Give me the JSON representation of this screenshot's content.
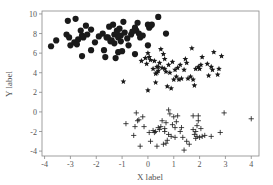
{
  "chart_data": {
    "type": "scatter",
    "title": "",
    "xlabel": "X label",
    "ylabel": "Y label",
    "xlim": [
      -4.1,
      4.3
    ],
    "ylim": [
      -4.5,
      10.3
    ],
    "xticks": [
      -4,
      -3,
      -2,
      -1,
      0,
      1,
      2,
      3,
      4
    ],
    "yticks": [
      -4,
      -2,
      0,
      2,
      4,
      6,
      8,
      10
    ],
    "grid": false,
    "legend": null,
    "series": [
      {
        "name": "cluster-1",
        "marker": "circle",
        "color": "#1a1a1a",
        "points": [
          [
            -3.75,
            6.7
          ],
          [
            -3.55,
            7.3
          ],
          [
            -3.1,
            9.3
          ],
          [
            -3.15,
            7.9
          ],
          [
            -3.05,
            7.6
          ],
          [
            -3.0,
            6.8
          ],
          [
            -2.85,
            7.1
          ],
          [
            -2.8,
            9.5
          ],
          [
            -2.75,
            6.9
          ],
          [
            -2.6,
            8.3
          ],
          [
            -2.55,
            7.8
          ],
          [
            -2.5,
            7.6
          ],
          [
            -2.55,
            5.7
          ],
          [
            -2.4,
            8.8
          ],
          [
            -2.35,
            7.9
          ],
          [
            -2.2,
            8.4
          ],
          [
            -2.2,
            6.3
          ],
          [
            -2.05,
            7.1
          ],
          [
            -1.9,
            7.7
          ],
          [
            -1.75,
            8.0
          ],
          [
            -1.7,
            6.3
          ],
          [
            -1.65,
            5.6
          ],
          [
            -1.55,
            7.6
          ],
          [
            -1.5,
            8.7
          ],
          [
            -1.45,
            7.2
          ],
          [
            -1.35,
            8.9
          ],
          [
            -1.3,
            7.9
          ],
          [
            -1.3,
            7.0
          ],
          [
            -1.2,
            8.3
          ],
          [
            -1.2,
            8.0
          ],
          [
            -1.15,
            7.6
          ],
          [
            -1.1,
            8.5
          ],
          [
            -1.05,
            7.8
          ],
          [
            -1.0,
            6.2
          ],
          [
            -1.25,
            5.5
          ],
          [
            -1.15,
            6.1
          ],
          [
            -0.95,
            9.2
          ],
          [
            -0.9,
            8.1
          ],
          [
            -0.8,
            7.5
          ],
          [
            -0.75,
            6.8
          ],
          [
            -0.65,
            7.9
          ],
          [
            -0.5,
            8.6
          ],
          [
            -0.45,
            8.3
          ],
          [
            -0.4,
            9.1
          ],
          [
            -0.35,
            8.0
          ],
          [
            -0.3,
            7.6
          ],
          [
            -0.2,
            7.8
          ],
          [
            -0.5,
            5.9
          ],
          [
            -1.05,
            7.2
          ],
          [
            0.0,
            8.9
          ],
          [
            0.05,
            8.6
          ],
          [
            0.1,
            8.8
          ],
          [
            0.15,
            8.9
          ],
          [
            0.4,
            9.7
          ],
          [
            0.0,
            6.8
          ],
          [
            0.7,
            8.0
          ],
          [
            -1.4,
            7.3
          ],
          [
            -1.6,
            7.6
          ],
          [
            -2.7,
            7.4
          ],
          [
            -0.6,
            8.2
          ]
        ]
      },
      {
        "name": "cluster-2",
        "marker": "star",
        "color": "#1a1a1a",
        "points": [
          [
            -0.95,
            3.1
          ],
          [
            -0.25,
            5.2
          ],
          [
            -0.1,
            5.5
          ],
          [
            -0.05,
            4.9
          ],
          [
            0.0,
            6.0
          ],
          [
            0.05,
            5.6
          ],
          [
            0.1,
            5.3
          ],
          [
            0.2,
            4.4
          ],
          [
            0.25,
            5.2
          ],
          [
            0.3,
            3.9
          ],
          [
            0.35,
            4.0
          ],
          [
            0.35,
            4.6
          ],
          [
            0.4,
            4.2
          ],
          [
            0.45,
            5.0
          ],
          [
            0.5,
            6.4
          ],
          [
            0.55,
            4.5
          ],
          [
            0.6,
            5.9
          ],
          [
            0.65,
            5.4
          ],
          [
            0.7,
            4.1
          ],
          [
            0.75,
            2.6
          ],
          [
            0.8,
            4.8
          ],
          [
            0.85,
            4.0
          ],
          [
            0.9,
            2.4
          ],
          [
            0.95,
            5.1
          ],
          [
            1.0,
            3.3
          ],
          [
            1.05,
            4.3
          ],
          [
            1.1,
            3.6
          ],
          [
            1.15,
            4.5
          ],
          [
            1.2,
            3.3
          ],
          [
            1.25,
            4.8
          ],
          [
            1.3,
            3.4
          ],
          [
            1.4,
            4.3
          ],
          [
            1.45,
            5.4
          ],
          [
            1.5,
            5.0
          ],
          [
            1.55,
            3.4
          ],
          [
            1.65,
            3.6
          ],
          [
            1.7,
            6.5
          ],
          [
            1.75,
            3.3
          ],
          [
            1.8,
            2.7
          ],
          [
            1.85,
            4.4
          ],
          [
            1.95,
            4.6
          ],
          [
            2.0,
            4.4
          ],
          [
            2.05,
            4.8
          ],
          [
            2.1,
            5.6
          ],
          [
            2.3,
            4.9
          ],
          [
            2.35,
            3.7
          ],
          [
            2.45,
            4.6
          ],
          [
            2.5,
            4.3
          ],
          [
            2.55,
            6.1
          ],
          [
            2.7,
            3.8
          ],
          [
            2.75,
            4.4
          ],
          [
            2.85,
            5.7
          ],
          [
            0.0,
            2.2
          ],
          [
            0.3,
            3.0
          ],
          [
            0.65,
            4.4
          ],
          [
            0.4,
            4.6
          ]
        ]
      },
      {
        "name": "cluster-3",
        "marker": "plus",
        "color": "#1a1a1a",
        "points": [
          [
            -0.85,
            -1.2
          ],
          [
            -0.55,
            -2.4
          ],
          [
            -0.5,
            -1.5
          ],
          [
            -0.45,
            -0.1
          ],
          [
            -0.4,
            -0.9
          ],
          [
            -0.35,
            -0.8
          ],
          [
            -0.3,
            -3.5
          ],
          [
            -0.2,
            -0.5
          ],
          [
            -0.15,
            -1.5
          ],
          [
            0.05,
            -2.1
          ],
          [
            0.1,
            -3.0
          ],
          [
            0.25,
            -2.1
          ],
          [
            0.3,
            -2.0
          ],
          [
            0.35,
            -3.5
          ],
          [
            0.4,
            -1.6
          ],
          [
            0.45,
            -1.8
          ],
          [
            0.5,
            -1.5
          ],
          [
            0.55,
            -0.9
          ],
          [
            0.6,
            -3.3
          ],
          [
            0.65,
            -1.7
          ],
          [
            0.7,
            -3.2
          ],
          [
            0.75,
            -2.9
          ],
          [
            0.8,
            -2.3
          ],
          [
            0.8,
            0.2
          ],
          [
            0.85,
            -0.2
          ],
          [
            0.9,
            -2.5
          ],
          [
            0.95,
            -1.3
          ],
          [
            1.0,
            -0.5
          ],
          [
            1.05,
            -2.6
          ],
          [
            1.1,
            -1.0
          ],
          [
            1.15,
            -0.4
          ],
          [
            1.3,
            -1.6
          ],
          [
            1.35,
            -2.6
          ],
          [
            1.4,
            -3.9
          ],
          [
            1.5,
            -3.0
          ],
          [
            1.6,
            -3.3
          ],
          [
            1.75,
            -0.4
          ],
          [
            1.75,
            -1.8
          ],
          [
            1.8,
            -2.3
          ],
          [
            1.85,
            -2.7
          ],
          [
            1.9,
            -1.4
          ],
          [
            1.9,
            -2.5
          ],
          [
            1.95,
            -0.4
          ],
          [
            1.95,
            -0.9
          ],
          [
            2.0,
            -2.6
          ],
          [
            2.05,
            -1.7
          ],
          [
            2.1,
            -2.5
          ],
          [
            2.2,
            -2.4
          ],
          [
            2.45,
            -2.5
          ],
          [
            2.8,
            -2.1
          ],
          [
            2.95,
            -0.1
          ],
          [
            4.0,
            -0.7
          ],
          [
            0.65,
            -2.0
          ],
          [
            1.85,
            -2.0
          ],
          [
            1.25,
            -2.0
          ],
          [
            0.2,
            -1.9
          ],
          [
            0.7,
            -1.1
          ],
          [
            1.05,
            -1.6
          ]
        ]
      }
    ]
  }
}
